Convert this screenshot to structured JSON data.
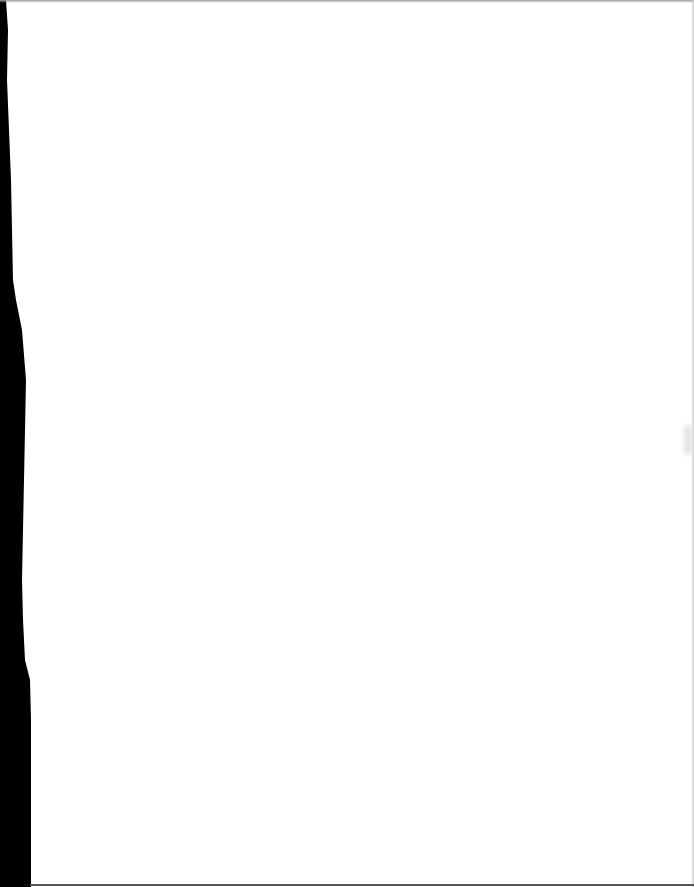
{
  "document": {
    "type": "scanned-page",
    "content": "",
    "colors": {
      "paper": "#ffffff",
      "scan_border": "#000000"
    }
  }
}
